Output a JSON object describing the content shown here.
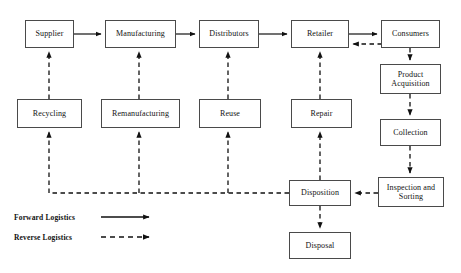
{
  "diagram": {
    "colors": {
      "box_border": "#4a4a4a",
      "line": "#111111",
      "text": "#121212",
      "background": "#ffffff"
    },
    "nodes": [
      {
        "id": "supplier",
        "label": "Supplier",
        "x": 25,
        "y": 20,
        "w": 49,
        "h": 28
      },
      {
        "id": "manufacturing",
        "label": "Manufacturing",
        "x": 105,
        "y": 20,
        "w": 71,
        "h": 28
      },
      {
        "id": "distributors",
        "label": "Distributors",
        "x": 199,
        "y": 20,
        "w": 60,
        "h": 28
      },
      {
        "id": "retailer",
        "label": "Retailer",
        "x": 291,
        "y": 20,
        "w": 58,
        "h": 28
      },
      {
        "id": "consumers",
        "label": "Consumers",
        "x": 381,
        "y": 20,
        "w": 59,
        "h": 28
      },
      {
        "id": "recycling",
        "label": "Recycling",
        "x": 17,
        "y": 99,
        "w": 65,
        "h": 29
      },
      {
        "id": "remanufacturing",
        "label": "Remanufacturing",
        "x": 101,
        "y": 99,
        "w": 79,
        "h": 29
      },
      {
        "id": "reuse",
        "label": "Reuse",
        "x": 199,
        "y": 99,
        "w": 62,
        "h": 29
      },
      {
        "id": "repair",
        "label": "Repair",
        "x": 291,
        "y": 99,
        "w": 61,
        "h": 29
      },
      {
        "id": "product_acq",
        "label": "Product\nAcquisition",
        "x": 380,
        "y": 64,
        "w": 61,
        "h": 30
      },
      {
        "id": "collection",
        "label": "Collection",
        "x": 380,
        "y": 119,
        "w": 61,
        "h": 27
      },
      {
        "id": "inspection",
        "label": "Inspection and\nSorting",
        "x": 378,
        "y": 177,
        "w": 66,
        "h": 30
      },
      {
        "id": "disposition",
        "label": "Disposition",
        "x": 289,
        "y": 180,
        "w": 62,
        "h": 26
      },
      {
        "id": "disposal",
        "label": "Disposal",
        "x": 289,
        "y": 232,
        "w": 62,
        "h": 27
      }
    ],
    "edges": [
      {
        "id": "supplier-to-manufacturing",
        "from": "supplier",
        "to": "manufacturing",
        "type": "forward"
      },
      {
        "id": "manufacturing-to-distributors",
        "from": "manufacturing",
        "to": "distributors",
        "type": "forward"
      },
      {
        "id": "distributors-to-retailer",
        "from": "distributors",
        "to": "retailer",
        "type": "forward"
      },
      {
        "id": "retailer-to-consumers",
        "from": "retailer",
        "to": "consumers",
        "type": "forward"
      },
      {
        "id": "consumers-to-retailer",
        "from": "consumers",
        "to": "retailer",
        "type": "reverse"
      },
      {
        "id": "consumers-to-product-acq",
        "from": "consumers",
        "to": "product_acq",
        "type": "reverse"
      },
      {
        "id": "product-acq-to-collection",
        "from": "product_acq",
        "to": "collection",
        "type": "reverse"
      },
      {
        "id": "collection-to-inspection",
        "from": "collection",
        "to": "inspection",
        "type": "reverse"
      },
      {
        "id": "inspection-to-disposition",
        "from": "inspection",
        "to": "disposition",
        "type": "reverse"
      },
      {
        "id": "disposition-to-disposal",
        "from": "disposition",
        "to": "disposal",
        "type": "reverse"
      },
      {
        "id": "disposition-to-repair",
        "from": "disposition",
        "to": "repair",
        "type": "reverse"
      },
      {
        "id": "trunk-to-reuse",
        "from": "disposition",
        "to": "reuse",
        "type": "reverse"
      },
      {
        "id": "trunk-to-remanufacturing",
        "from": "disposition",
        "to": "remanufacturing",
        "type": "reverse"
      },
      {
        "id": "trunk-to-recycling",
        "from": "disposition",
        "to": "recycling",
        "type": "reverse"
      },
      {
        "id": "recycling-to-supplier",
        "from": "recycling",
        "to": "supplier",
        "type": "reverse"
      },
      {
        "id": "remanufacturing-to-manufacturing",
        "from": "remanufacturing",
        "to": "manufacturing",
        "type": "reverse"
      },
      {
        "id": "reuse-to-distributors",
        "from": "reuse",
        "to": "distributors",
        "type": "reverse"
      },
      {
        "id": "repair-to-retailer",
        "from": "repair",
        "to": "retailer",
        "type": "reverse"
      }
    ]
  },
  "legend": {
    "forward": {
      "label": "Forward Logistics",
      "style": "solid-arrow"
    },
    "reverse": {
      "label": "Reverse Logistics",
      "style": "dashed-arrow"
    }
  }
}
